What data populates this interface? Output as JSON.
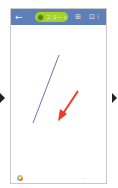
{
  "stage": {
    "left_arrow": "▶",
    "right_arrow": "▶"
  },
  "topbar": {
    "background": "#5f7fb8",
    "back_icon": "←",
    "pill": {
      "label": "スタート",
      "color": "#a6d12b"
    },
    "grid_icon": "⊞",
    "more_icon": "⊡ ⁝"
  },
  "canvas": {
    "background": "#ffffff",
    "line": {
      "color": "#6a72b8",
      "x1": 48,
      "y1": 46,
      "x2": 22,
      "y2": 114
    },
    "arrow": {
      "color": "#ee3b24",
      "x1": 67,
      "y1": 82,
      "x2": 50,
      "y2": 108
    }
  },
  "bottombar": {
    "palette_icon": "palette",
    "text": "—"
  }
}
